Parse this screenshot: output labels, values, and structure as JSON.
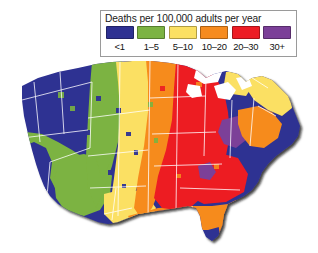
{
  "legend": {
    "title": "Deaths per 100,000 adults per year",
    "bins": [
      {
        "label": "<1",
        "color": "#2e3192"
      },
      {
        "label": "1–5",
        "color": "#7cb342"
      },
      {
        "label": "5–10",
        "color": "#fbe063"
      },
      {
        "label": "10–20",
        "color": "#f68b1f"
      },
      {
        "label": "20–30",
        "color": "#ed1c24"
      },
      {
        "label": "30+",
        "color": "#7b3f98"
      }
    ]
  },
  "map": {
    "name": "contiguous-united-states-choropleth",
    "background": "#ffffff",
    "border_color": "#ffffff",
    "shadow_color": "#1a1a1a",
    "lake_color": "#ffffff",
    "regions": [
      {
        "name": "pacific-northwest",
        "bin": "<1",
        "color": "#2e3192"
      },
      {
        "name": "northern-rockies",
        "bin": "<1",
        "color": "#2e3192"
      },
      {
        "name": "great-basin",
        "bin": "<1",
        "color": "#2e3192"
      },
      {
        "name": "california-coast",
        "bin": "1–5",
        "color": "#7cb342"
      },
      {
        "name": "southwest",
        "bin": "1–5",
        "color": "#7cb342"
      },
      {
        "name": "northern-plains",
        "bin": "1–5",
        "color": "#7cb342"
      },
      {
        "name": "central-plains",
        "bin": "5–10",
        "color": "#fbe063"
      },
      {
        "name": "texas",
        "bin": "5–10",
        "color": "#fbe063"
      },
      {
        "name": "upper-midwest",
        "bin": "10–20",
        "color": "#f68b1f"
      },
      {
        "name": "lower-midwest",
        "bin": "20–30",
        "color": "#ed1c24"
      },
      {
        "name": "southeast",
        "bin": "20–30",
        "color": "#ed1c24"
      },
      {
        "name": "gulf-coast",
        "bin": "10–20",
        "color": "#f68b1f"
      },
      {
        "name": "florida-peninsula",
        "bin": "10–20",
        "color": "#f68b1f"
      },
      {
        "name": "south-florida-tip",
        "bin": "5–10",
        "color": "#fbe063"
      },
      {
        "name": "appalachia",
        "bin": "30+",
        "color": "#7b3f98"
      },
      {
        "name": "mid-atlantic",
        "bin": "10–20",
        "color": "#f68b1f"
      },
      {
        "name": "northeast",
        "bin": "5–10",
        "color": "#fbe063"
      },
      {
        "name": "great-lakes-water",
        "bin": "none",
        "color": "#ffffff"
      }
    ]
  }
}
